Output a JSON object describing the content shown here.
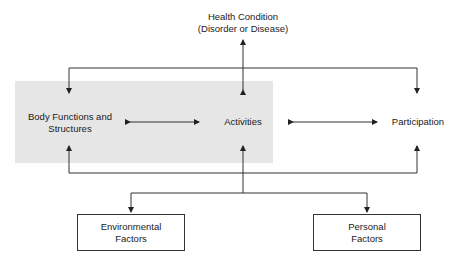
{
  "diagram": {
    "health_condition": {
      "line1": "Health Condition",
      "line2": "(Disorder or Disease)"
    },
    "body_functions": {
      "line1": "Body Functions and",
      "line2": "Structures"
    },
    "activities": {
      "label": "Activities"
    },
    "participation": {
      "label": "Participation"
    },
    "environmental_factors": {
      "line1": "Environmental",
      "line2": "Factors"
    },
    "personal_factors": {
      "line1": "Personal",
      "line2": "Factors"
    },
    "colors": {
      "line": "#333333",
      "highlight": "#e6e6e6"
    }
  }
}
